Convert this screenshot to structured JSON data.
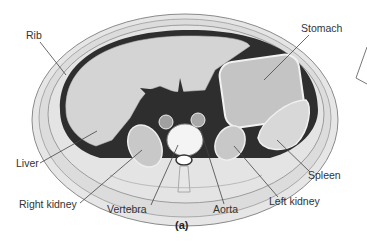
{
  "figure": {
    "panel_label": "(a)",
    "labels": {
      "rib": "Rib",
      "stomach": "Stomach",
      "liver": "Liver",
      "spleen": "Spleen",
      "right_kidney": "Right kidney",
      "vertebra": "Vertebra",
      "aorta": "Aorta",
      "left_kidney": "Left kidney"
    }
  },
  "colors": {
    "organ_fill": "#d6d6d6",
    "dark_cavity": "#2b2b2b",
    "tissue": "#e2e2e2",
    "outline": "#7a7a7a",
    "leader_line": "#444444",
    "text": "#333333"
  }
}
